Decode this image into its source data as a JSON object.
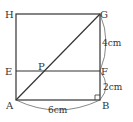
{
  "figure": {
    "points": {
      "H": "H",
      "G": "G",
      "E": "E",
      "P": "P",
      "F": "F",
      "A": "A",
      "B": "B"
    },
    "dimensions": {
      "FG": "4cm",
      "BF": "2cm",
      "AB": "6cm"
    },
    "colors": {
      "line": "#333333",
      "background": "#ffffff"
    }
  }
}
